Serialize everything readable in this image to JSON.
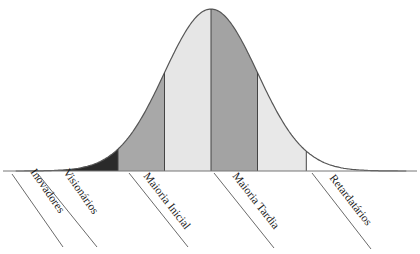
{
  "diagram": {
    "type": "technology-adoption-bell-curve",
    "segments": [
      {
        "id": "inovadores",
        "label": "Inovadores",
        "color": "#2a2a2a"
      },
      {
        "id": "visionarios",
        "label": "Visionários",
        "color": "#a8a8a8"
      },
      {
        "id": "maioria-inicial",
        "label": "Maioria Inicial",
        "color": "#e6e6e6"
      },
      {
        "id": "maioria-tardia",
        "label": "Maioria Tardia",
        "color": "#a3a3a3"
      },
      {
        "id": "retardatarios",
        "label": "Retardatários",
        "color": "#e8e8e8"
      }
    ],
    "boundaries_sigma": [
      -4.2,
      -2,
      -1,
      0,
      1,
      2.05,
      4.2
    ],
    "outline_color": "#555555",
    "divider_color": "#444444"
  }
}
